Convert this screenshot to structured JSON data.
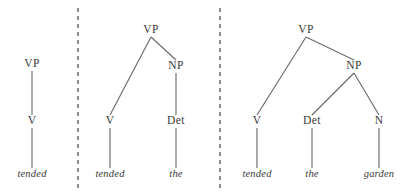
{
  "figure": {
    "type": "syntax-tree-derivation",
    "background_color": "#ffffff",
    "line_color": "#6b6b6b",
    "text_color": "#3a3a3a",
    "divider_color": "#2f2f2f",
    "dividers": [
      {
        "name": "divider-1",
        "x": 78
      },
      {
        "name": "divider-2",
        "x": 220
      }
    ],
    "trees": [
      {
        "id": "tree-1",
        "nodes": [
          {
            "id": "t1-vp",
            "label": "VP",
            "kind": "nonterminal",
            "x": 32,
            "y": 67
          },
          {
            "id": "t1-v",
            "label": "V",
            "kind": "nonterminal",
            "x": 32,
            "y": 124
          },
          {
            "id": "t1-tended",
            "label": "tended",
            "kind": "terminal",
            "x": 32,
            "y": 177
          }
        ],
        "edges": [
          {
            "from": "t1-vp",
            "to": "t1-v"
          },
          {
            "from": "t1-v",
            "to": "t1-tended"
          }
        ]
      },
      {
        "id": "tree-2",
        "nodes": [
          {
            "id": "t2-vp",
            "label": "VP",
            "kind": "nonterminal",
            "x": 151,
            "y": 33
          },
          {
            "id": "t2-v",
            "label": "V",
            "kind": "nonterminal",
            "x": 110,
            "y": 124
          },
          {
            "id": "t2-np",
            "label": "NP",
            "kind": "nonterminal",
            "x": 176,
            "y": 69
          },
          {
            "id": "t2-det",
            "label": "Det",
            "kind": "nonterminal",
            "x": 176,
            "y": 124
          },
          {
            "id": "t2-tended",
            "label": "tended",
            "kind": "terminal",
            "x": 110,
            "y": 177
          },
          {
            "id": "t2-the",
            "label": "the",
            "kind": "terminal",
            "x": 176,
            "y": 177
          }
        ],
        "edges": [
          {
            "from": "t2-vp",
            "to": "t2-v"
          },
          {
            "from": "t2-vp",
            "to": "t2-np"
          },
          {
            "from": "t2-np",
            "to": "t2-det"
          },
          {
            "from": "t2-v",
            "to": "t2-tended"
          },
          {
            "from": "t2-det",
            "to": "t2-the"
          }
        ]
      },
      {
        "id": "tree-3",
        "nodes": [
          {
            "id": "t3-vp",
            "label": "VP",
            "kind": "nonterminal",
            "x": 306,
            "y": 33
          },
          {
            "id": "t3-v",
            "label": "V",
            "kind": "nonterminal",
            "x": 257,
            "y": 124
          },
          {
            "id": "t3-np",
            "label": "NP",
            "kind": "nonterminal",
            "x": 354,
            "y": 69
          },
          {
            "id": "t3-det",
            "label": "Det",
            "kind": "nonterminal",
            "x": 312,
            "y": 124
          },
          {
            "id": "t3-n",
            "label": "N",
            "kind": "nonterminal",
            "x": 379,
            "y": 124
          },
          {
            "id": "t3-tended",
            "label": "tended",
            "kind": "terminal",
            "x": 257,
            "y": 177
          },
          {
            "id": "t3-the",
            "label": "the",
            "kind": "terminal",
            "x": 312,
            "y": 177
          },
          {
            "id": "t3-garden",
            "label": "garden",
            "kind": "terminal",
            "x": 379,
            "y": 177
          }
        ],
        "edges": [
          {
            "from": "t3-vp",
            "to": "t3-v"
          },
          {
            "from": "t3-vp",
            "to": "t3-np"
          },
          {
            "from": "t3-np",
            "to": "t3-det"
          },
          {
            "from": "t3-np",
            "to": "t3-n"
          },
          {
            "from": "t3-v",
            "to": "t3-tended"
          },
          {
            "from": "t3-det",
            "to": "t3-the"
          },
          {
            "from": "t3-n",
            "to": "t3-garden"
          }
        ]
      }
    ]
  }
}
